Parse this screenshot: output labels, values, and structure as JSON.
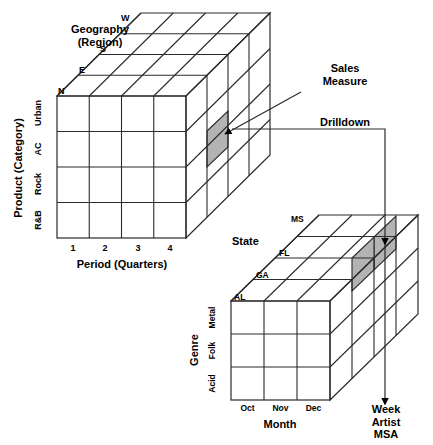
{
  "diagram": {
    "background_color": "#ffffff",
    "line_color": "#2b2b2b",
    "highlight_color": "#b3b3b3"
  },
  "cube_top": {
    "name": "sales-cube",
    "depth_axis": {
      "label": "Geography\n(Region)",
      "label_line1": "Geography",
      "label_line2": "(Region)",
      "ticks": [
        "N",
        "E",
        "S",
        "W"
      ]
    },
    "vertical_axis": {
      "label": "Product (Category)",
      "ticks": [
        "Urban",
        "AC",
        "Rock",
        "R&B"
      ]
    },
    "horizontal_axis": {
      "label": "Period (Quarters)",
      "ticks": [
        "1",
        "2",
        "3",
        "4"
      ]
    },
    "grid": {
      "columns": 4,
      "rows": 4,
      "slices": 4
    }
  },
  "cube_bottom": {
    "name": "drilldown-cube",
    "depth_axis": {
      "label": "State",
      "ticks": [
        "AL",
        "GA",
        "FL",
        "MS"
      ]
    },
    "vertical_axis": {
      "label": "Genre",
      "ticks": [
        "Metal",
        "Folk",
        "Acid"
      ]
    },
    "horizontal_axis": {
      "label": "Month",
      "ticks": [
        "Oct",
        "Nov",
        "Dec"
      ]
    },
    "grid": {
      "columns": 3,
      "rows": 3,
      "slices": 4
    }
  },
  "callouts": {
    "sales_measure_line1": "Sales",
    "sales_measure_line2": "Measure",
    "drilldown": "Drilldown",
    "next_levels": [
      "Week",
      "Artist",
      "MSA"
    ]
  }
}
